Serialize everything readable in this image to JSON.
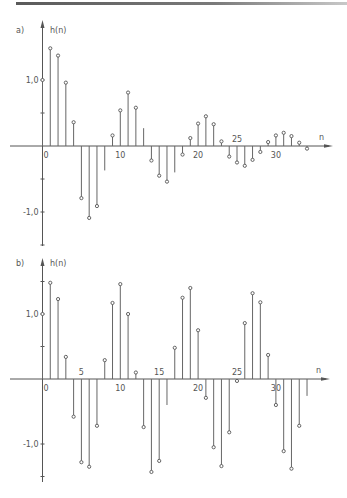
{
  "chart_data": [
    {
      "type": "stem",
      "panel_label": "a)",
      "ylabel": "h(n)",
      "xlabel": "n",
      "ytick_labels": [
        "1,0",
        "-1,0"
      ],
      "yticks": [
        1.0,
        0.5,
        -0.5,
        -1.0,
        -1.5
      ],
      "xtick_labels": [
        {
          "n": 0,
          "label": "0"
        },
        {
          "n": 10,
          "label": "10"
        },
        {
          "n": 20,
          "label": "20"
        },
        {
          "n": 25,
          "label": "25"
        },
        {
          "n": 30,
          "label": "30"
        }
      ],
      "n": [
        0,
        1,
        2,
        3,
        4,
        5,
        6,
        7,
        8,
        9,
        10,
        11,
        12,
        13,
        14,
        15,
        16,
        17,
        18,
        19,
        20,
        21,
        22,
        23,
        24,
        25,
        26,
        27,
        28,
        29,
        30,
        31,
        32,
        33,
        34
      ],
      "values": [
        1.0,
        1.48,
        1.37,
        0.96,
        0.36,
        -0.79,
        -1.09,
        -0.91,
        -0.37,
        0.16,
        0.54,
        0.81,
        0.58,
        0.27,
        -0.22,
        -0.45,
        -0.54,
        -0.4,
        -0.13,
        0.12,
        0.34,
        0.45,
        0.33,
        0.07,
        -0.16,
        -0.25,
        -0.3,
        -0.21,
        -0.09,
        0.06,
        0.16,
        0.2,
        0.15,
        0.05,
        -0.04
      ],
      "markers": [
        1,
        1,
        1,
        1,
        1,
        1,
        1,
        1,
        0,
        1,
        1,
        1,
        1,
        0,
        1,
        1,
        1,
        0,
        1,
        1,
        1,
        1,
        1,
        1,
        1,
        1,
        1,
        1,
        1,
        1,
        1,
        1,
        1,
        1,
        1
      ],
      "ylim": [
        -1.55,
        1.75
      ],
      "grid": false
    },
    {
      "type": "stem",
      "panel_label": "b)",
      "ylabel": "h(n)",
      "xlabel": "n",
      "ytick_labels": [
        "1,0",
        "-1,0"
      ],
      "yticks": [
        1.5,
        1.0,
        0.5,
        -1.0,
        -1.5
      ],
      "xtick_labels": [
        {
          "n": 0,
          "label": "0"
        },
        {
          "n": 5,
          "label": "5"
        },
        {
          "n": 10,
          "label": "10"
        },
        {
          "n": 15,
          "label": "15"
        },
        {
          "n": 20,
          "label": "20"
        },
        {
          "n": 25,
          "label": "25"
        },
        {
          "n": 30,
          "label": "30"
        }
      ],
      "n": [
        0,
        1,
        2,
        3,
        4,
        5,
        6,
        7,
        8,
        9,
        10,
        11,
        12,
        13,
        14,
        15,
        16,
        17,
        18,
        19,
        20,
        21,
        22,
        23,
        24,
        25,
        26,
        27,
        28,
        29,
        30,
        31,
        32,
        33,
        34
      ],
      "values": [
        1.0,
        1.48,
        1.23,
        0.34,
        -0.58,
        -1.28,
        -1.35,
        -0.72,
        0.29,
        1.17,
        1.46,
        1.0,
        0.1,
        -0.74,
        -1.43,
        -1.26,
        -0.4,
        0.48,
        1.25,
        1.4,
        0.75,
        -0.29,
        -1.05,
        -1.34,
        -0.82,
        -0.03,
        0.86,
        1.32,
        1.18,
        0.37,
        -0.4,
        -1.11,
        -1.38,
        -0.72,
        -0.26
      ],
      "markers": [
        1,
        1,
        1,
        1,
        1,
        1,
        1,
        1,
        1,
        1,
        1,
        1,
        1,
        1,
        1,
        1,
        0,
        1,
        1,
        1,
        1,
        1,
        1,
        1,
        1,
        1,
        1,
        1,
        1,
        1,
        1,
        1,
        1,
        1,
        0
      ],
      "ylim": [
        -1.6,
        1.75
      ],
      "grid": false
    }
  ]
}
